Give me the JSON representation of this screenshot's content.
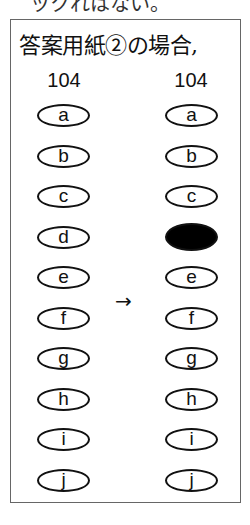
{
  "top_text": "ックれはない。",
  "title": "答案用紙②の場合,",
  "arrow": "→",
  "before": {
    "question_number": "104",
    "options": [
      {
        "label": "a",
        "filled": false
      },
      {
        "label": "b",
        "filled": false
      },
      {
        "label": "c",
        "filled": false
      },
      {
        "label": "d",
        "filled": false
      },
      {
        "label": "e",
        "filled": false
      },
      {
        "label": "f",
        "filled": false
      },
      {
        "label": "g",
        "filled": false
      },
      {
        "label": "h",
        "filled": false
      },
      {
        "label": "i",
        "filled": false
      },
      {
        "label": "j",
        "filled": false
      }
    ]
  },
  "after": {
    "question_number": "104",
    "options": [
      {
        "label": "a",
        "filled": false
      },
      {
        "label": "b",
        "filled": false
      },
      {
        "label": "c",
        "filled": false
      },
      {
        "label": "d",
        "filled": true
      },
      {
        "label": "e",
        "filled": false
      },
      {
        "label": "f",
        "filled": false
      },
      {
        "label": "g",
        "filled": false
      },
      {
        "label": "h",
        "filled": false
      },
      {
        "label": "i",
        "filled": false
      },
      {
        "label": "j",
        "filled": false
      }
    ]
  }
}
